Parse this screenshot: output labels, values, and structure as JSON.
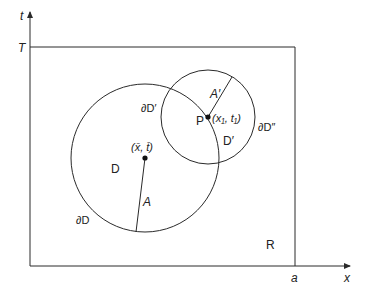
{
  "axes": {
    "t_label": "t",
    "x_label": "x",
    "T_label": "T",
    "a_label": "a"
  },
  "region": {
    "label": "R"
  },
  "big_circle": {
    "interior_label": "D",
    "boundary_label": "∂D",
    "center_label": "(x̄, t̄)",
    "radius_label": "A"
  },
  "small_circle": {
    "interior_label": "D′",
    "boundary_left_label": "∂D′",
    "boundary_right_label": "∂D″",
    "point_label": "P",
    "point_coords_label": "(x₁, t₁)",
    "radius_label": "A′"
  },
  "colors": {
    "stroke": "#2a2a2a",
    "background": "#ffffff"
  }
}
